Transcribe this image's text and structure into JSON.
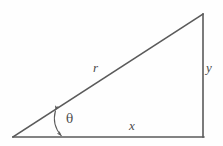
{
  "figure": {
    "kind": "right-triangle-diagram",
    "background_color": "#fefefe",
    "stroke_color": "#5a5a5a",
    "label_color": "#4a4a4a",
    "stroke_width": 1.5,
    "canvas": {
      "width": 223,
      "height": 146
    }
  },
  "geometry": {
    "vertices": {
      "origin": {
        "x": 13,
        "y": 137
      },
      "apex": {
        "x": 203,
        "y": 14
      },
      "right_angle": {
        "x": 203,
        "y": 137
      }
    },
    "sides": {
      "hypotenuse": {
        "from": "origin",
        "to": "apex",
        "label": "r"
      },
      "base": {
        "from": "origin",
        "to": "right_angle",
        "label": "x"
      },
      "vertical": {
        "from": "right_angle",
        "to": "apex",
        "label": "y"
      }
    },
    "angle_marker": {
      "label": "theta",
      "style": "double-headed-curved-arrow",
      "from": {
        "x": 55,
        "y": 110
      },
      "to": {
        "x": 62,
        "y": 137
      },
      "control": {
        "x": 52,
        "y": 125
      }
    }
  },
  "labels": {
    "hypotenuse": "r",
    "vertical": "y",
    "base": "x",
    "angle": "θ"
  }
}
